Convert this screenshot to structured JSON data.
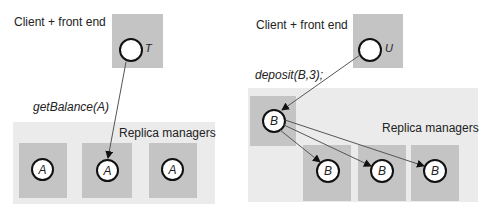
{
  "left": {
    "client_label": "Client + front end",
    "client_node": "T",
    "operation": "getBalance(A)",
    "replica_label": "Replica managers",
    "replicas": [
      "A",
      "A",
      "A"
    ]
  },
  "right": {
    "client_label": "Client + front end",
    "client_node": "U",
    "operation": "deposit(B,3);",
    "primary_node": "B",
    "replica_label": "Replica managers",
    "replicas": [
      "B",
      "B",
      "B"
    ]
  },
  "colors": {
    "panel": "#ebebeb",
    "box": "#c4c4c4",
    "line": "#555555"
  }
}
